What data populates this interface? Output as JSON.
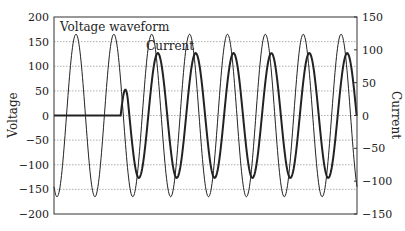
{
  "chart_data": {
    "type": "line",
    "title": "",
    "xlabel": "",
    "ylabel": "Voltage",
    "y2label": "Current",
    "ylim": [
      -200,
      200
    ],
    "y2lim": [
      -150,
      150
    ],
    "yticks": [
      200,
      150,
      100,
      50,
      0,
      -50,
      -100,
      -150,
      -200
    ],
    "y2ticks": [
      150,
      100,
      50,
      0,
      -50,
      -100,
      -150
    ],
    "grid": "horizontal dotted",
    "legend": "none",
    "annotations": [
      {
        "text": "Voltage waveform",
        "series": "Voltage"
      },
      {
        "text": "Current",
        "series": "Current"
      }
    ],
    "series": [
      {
        "name": "Voltage",
        "axis": "left",
        "shape": "sinusoid",
        "amplitude": 165,
        "cycles": 8,
        "peak_values": [
          165,
          165,
          165,
          165,
          165,
          165,
          165,
          165
        ],
        "trough_values": [
          -165,
          -165,
          -165,
          -165,
          -165,
          -165,
          -165,
          -165
        ],
        "color": "#222222",
        "line_width": 1
      },
      {
        "name": "Current",
        "axis": "right",
        "shape": "sinusoid with zero initial segment (inrush/step start)",
        "initial_value": 0,
        "starts_at_fraction_of_x": 0.22,
        "amplitude": 95,
        "first_trough": -95,
        "peak_values": [
          90,
          95,
          95,
          95,
          95,
          95
        ],
        "trough_values": [
          -95,
          -100,
          -100,
          -100,
          -100,
          -100
        ],
        "phase_lag_fraction_of_cycle": 0.16,
        "color": "#222222",
        "line_width": 2
      }
    ]
  }
}
